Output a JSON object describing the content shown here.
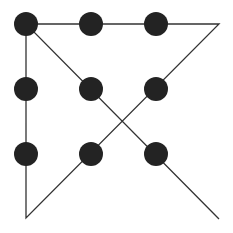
{
  "diagram": {
    "background": "#ffffff",
    "dot_color": "#232323",
    "line_color": "#333333",
    "dot_radius": 12,
    "line_width": 1.3,
    "dots": [
      {
        "row": 0,
        "col": 0,
        "x": 26,
        "y": 24
      },
      {
        "row": 0,
        "col": 1,
        "x": 91,
        "y": 24
      },
      {
        "row": 0,
        "col": 2,
        "x": 156,
        "y": 24
      },
      {
        "row": 1,
        "col": 0,
        "x": 26,
        "y": 89
      },
      {
        "row": 1,
        "col": 1,
        "x": 91,
        "y": 89
      },
      {
        "row": 1,
        "col": 2,
        "x": 156,
        "y": 89
      },
      {
        "row": 2,
        "col": 0,
        "x": 26,
        "y": 154
      },
      {
        "row": 2,
        "col": 1,
        "x": 91,
        "y": 154
      },
      {
        "row": 2,
        "col": 2,
        "x": 156,
        "y": 154
      }
    ],
    "path": [
      {
        "x": 219,
        "y": 219
      },
      {
        "x": 26,
        "y": 24
      },
      {
        "x": 219,
        "y": 24
      },
      {
        "x": 26,
        "y": 218
      },
      {
        "x": 26,
        "y": 24
      }
    ]
  }
}
